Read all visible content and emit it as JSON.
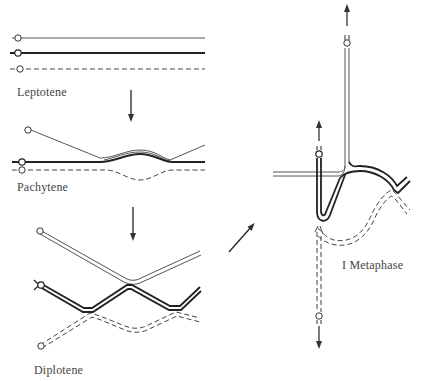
{
  "diagram": {
    "type": "meiosis-prophase-stages",
    "colors": {
      "background": "#ffffff",
      "stroke": "#333333",
      "label": "#444444"
    },
    "stages": [
      {
        "id": "leptotene",
        "label": "Leptotene"
      },
      {
        "id": "pachytene",
        "label": "Pachytene"
      },
      {
        "id": "diplotene",
        "label": "Diplotene"
      },
      {
        "id": "metaphase-1",
        "label": "I Metaphase"
      }
    ],
    "arrows": [
      {
        "from": "leptotene",
        "to": "pachytene",
        "direction": "down"
      },
      {
        "from": "pachytene",
        "to": "diplotene",
        "direction": "down"
      },
      {
        "from": "diplotene",
        "to": "metaphase-1",
        "direction": "up-right"
      }
    ],
    "chromosome_styles": [
      {
        "name": "thin-solid",
        "description": "thin solid chromatid line"
      },
      {
        "name": "thick-solid",
        "description": "thick solid chromatid line"
      },
      {
        "name": "dashed",
        "description": "dashed chromatid line"
      }
    ]
  }
}
